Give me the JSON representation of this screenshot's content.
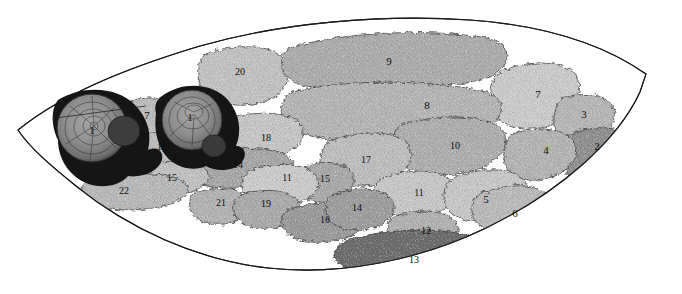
{
  "figure": {
    "background_color": "#ffffff",
    "outline_color": "#1a1a1a",
    "patch_border_color": "#2b2b2b",
    "label_color": "#0d0d0d"
  },
  "palette": {
    "very_light": "#dcdcdc",
    "light": "#d2d2d2",
    "light_mid": "#c8c8c8",
    "mid": "#bdbdbd",
    "mid_dark": "#b0b0b0",
    "dark_mid": "#a2a2a2",
    "dark": "#949494",
    "darker": "#868686",
    "very_dark": "#6d6d6d",
    "nucleus_dark": "#3a3a3a",
    "nucleus_core": "#8e8e8e",
    "nucleus_halo": "#151515"
  },
  "regions": [
    {
      "id": "r1a",
      "label": "1",
      "x": 92,
      "y": 131,
      "fill": "#8e8e8e",
      "kind": "nucleus"
    },
    {
      "id": "r1b",
      "label": "1",
      "x": 190,
      "y": 118,
      "fill": "#8e8e8e",
      "kind": "nucleus"
    },
    {
      "id": "r2",
      "label": "2",
      "x": 597,
      "y": 147,
      "fill": "#8f8f8f",
      "kind": "patch"
    },
    {
      "id": "r3",
      "label": "3",
      "x": 584,
      "y": 115,
      "fill": "#b6b6b6",
      "kind": "patch"
    },
    {
      "id": "r4",
      "label": "4",
      "x": 546,
      "y": 151,
      "fill": "#b3b3b3",
      "kind": "patch"
    },
    {
      "id": "r5",
      "label": "5",
      "x": 486,
      "y": 200,
      "fill": "#c6c6c6",
      "kind": "patch"
    },
    {
      "id": "r6",
      "label": "6",
      "x": 515,
      "y": 214,
      "fill": "#b9b9b9",
      "kind": "patch"
    },
    {
      "id": "r7t",
      "label": "7",
      "x": 538,
      "y": 95,
      "fill": "#c9c9c9",
      "kind": "patch"
    },
    {
      "id": "r7l",
      "label": "7",
      "x": 147,
      "y": 116,
      "fill": "#bcbcbc",
      "kind": "patch"
    },
    {
      "id": "r8",
      "label": "8",
      "x": 427,
      "y": 106,
      "fill": "#b4b4b4",
      "kind": "patch"
    },
    {
      "id": "r9",
      "label": "9",
      "x": 389,
      "y": 62,
      "fill": "#ababab",
      "kind": "patch"
    },
    {
      "id": "r10r",
      "label": "10",
      "x": 455,
      "y": 147,
      "fill": "#adadad",
      "kind": "patch"
    },
    {
      "id": "r10l",
      "label": "10",
      "x": 162,
      "y": 148,
      "fill": "#bdbdbd",
      "kind": "patch"
    },
    {
      "id": "r11m",
      "label": "11",
      "x": 287,
      "y": 179,
      "fill": "#cacaca",
      "kind": "patch"
    },
    {
      "id": "r11r",
      "label": "11",
      "x": 419,
      "y": 194,
      "fill": "#c6c6c6",
      "kind": "patch"
    },
    {
      "id": "r12",
      "label": "12",
      "x": 426,
      "y": 232,
      "fill": "#b0b0b0",
      "kind": "patch"
    },
    {
      "id": "r13",
      "label": "13",
      "x": 414,
      "y": 261,
      "fill": "#6d6d6d",
      "kind": "patch"
    },
    {
      "id": "r14l",
      "label": "14",
      "x": 238,
      "y": 166,
      "fill": "#a6a6a6",
      "kind": "patch"
    },
    {
      "id": "r14b",
      "label": "14",
      "x": 357,
      "y": 209,
      "fill": "#9d9d9d",
      "kind": "patch"
    },
    {
      "id": "r15l",
      "label": "15",
      "x": 172,
      "y": 179,
      "fill": "#bfbfbf",
      "kind": "patch"
    },
    {
      "id": "r15m",
      "label": "15",
      "x": 325,
      "y": 180,
      "fill": "#a8a8a8",
      "kind": "patch"
    },
    {
      "id": "r16",
      "label": "16",
      "x": 325,
      "y": 221,
      "fill": "#9a9a9a",
      "kind": "patch"
    },
    {
      "id": "r17",
      "label": "17",
      "x": 366,
      "y": 161,
      "fill": "#bcbcbc",
      "kind": "patch"
    },
    {
      "id": "r18",
      "label": "18",
      "x": 266,
      "y": 139,
      "fill": "#c4c4c4",
      "kind": "patch"
    },
    {
      "id": "r19",
      "label": "19",
      "x": 266,
      "y": 205,
      "fill": "#a9a9a9",
      "kind": "patch"
    },
    {
      "id": "r20",
      "label": "20",
      "x": 240,
      "y": 73,
      "fill": "#c0c0c0",
      "kind": "patch"
    },
    {
      "id": "r21",
      "label": "21",
      "x": 221,
      "y": 204,
      "fill": "#b2b2b2",
      "kind": "patch"
    },
    {
      "id": "r22",
      "label": "22",
      "x": 124,
      "y": 192,
      "fill": "#b8b8b8",
      "kind": "patch"
    }
  ],
  "label_list": [
    "1",
    "1",
    "2",
    "3",
    "4",
    "5",
    "6",
    "7",
    "7",
    "8",
    "9",
    "10",
    "10",
    "11",
    "11",
    "12",
    "13",
    "14",
    "14",
    "15",
    "15",
    "16",
    "17",
    "18",
    "19",
    "20",
    "21",
    "22"
  ]
}
